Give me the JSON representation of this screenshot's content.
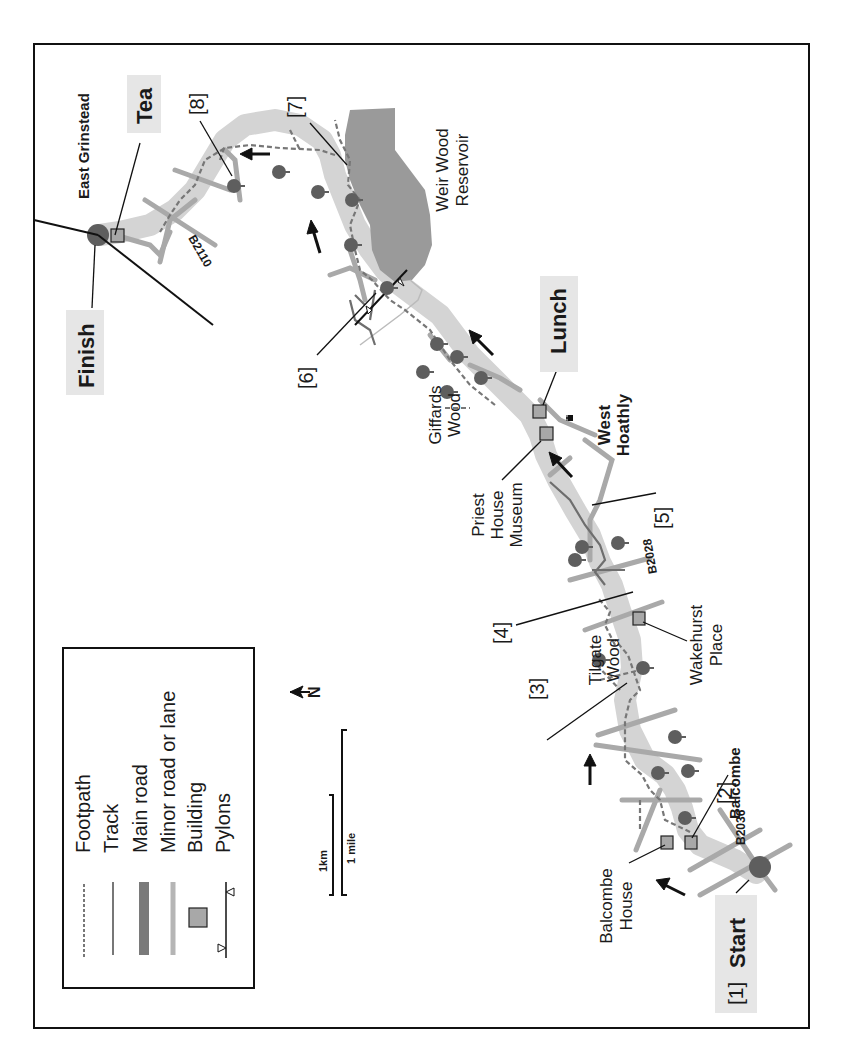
{
  "map": {
    "orientation": "rotated 90 degrees counter-clockwise",
    "legend": {
      "items": [
        {
          "symbol": "dashed-line",
          "label": "Footpath"
        },
        {
          "symbol": "thin-line",
          "label": "Track"
        },
        {
          "symbol": "thick-dark-line",
          "label": "Main road"
        },
        {
          "symbol": "light-line",
          "label": "Minor road or lane"
        },
        {
          "symbol": "square",
          "label": "Building"
        },
        {
          "symbol": "pylon-line",
          "label": "Pylons"
        }
      ]
    },
    "scale": {
      "km_label": "1km",
      "mile_label": "1 mile"
    },
    "north": {
      "label": "N"
    },
    "waypoints": {
      "start": {
        "number": "[1]",
        "label": "Start"
      },
      "p2": "[2]",
      "p3": "[3]",
      "p4": "[4]",
      "p5": "[5]",
      "p6": "[6]",
      "p7": "[7]",
      "p8": "[8]"
    },
    "stops": {
      "lunch": "Lunch",
      "tea": "Tea",
      "finish": "Finish"
    },
    "places": {
      "balcombe_house_1": "Balcombe",
      "balcombe_house_2": "House",
      "balcombe": "Balcombe",
      "tilgate_1": "Tilgate",
      "tilgate_2": "Wood",
      "wakehurst_1": "Wakehurst",
      "wakehurst_2": "Place",
      "priest_1": "Priest",
      "priest_2": "House",
      "priest_3": "Museum",
      "west_hoathly_1": "West",
      "west_hoathly_2": "Hoathly",
      "giffards_1": "Giffards",
      "giffards_2": "Wood",
      "weir_1": "Weir Wood",
      "weir_2": "Reservoir",
      "east_grinstead": "East Grinstead"
    },
    "roads": {
      "b2036": "B2036",
      "b2028": "B2028",
      "b2110": "B2110"
    },
    "colors": {
      "route_band": "#d4d4d4",
      "minor_road": "#a9a9a9",
      "main_road": "#7a7a7a",
      "reservoir": "#9a9a9a",
      "tree": "#5e5e5e",
      "building": "#a8a8a8",
      "label_box": "#e6e6e6",
      "ink": "#1a1a1a"
    }
  }
}
